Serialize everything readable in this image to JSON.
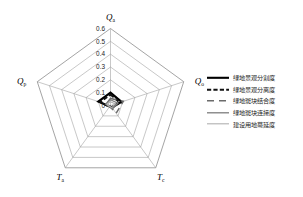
{
  "chart_data": {
    "type": "radar",
    "title": "",
    "categories": [
      "Q_a",
      "Q_o",
      "T_c",
      "T_a",
      "Q_p"
    ],
    "category_labels": [
      {
        "base": "Q",
        "sub": "a"
      },
      {
        "base": "Q",
        "sub": "o"
      },
      {
        "base": "T",
        "sub": "c"
      },
      {
        "base": "T",
        "sub": "a"
      },
      {
        "base": "Q",
        "sub": "p"
      }
    ],
    "tick_labels": [
      "0.6",
      "0.5",
      "0.4",
      "0.3",
      "0.2",
      "0.1",
      "0"
    ],
    "tick_values": [
      0.6,
      0.5,
      0.4,
      0.3,
      0.2,
      0.1,
      0
    ],
    "rlim": [
      0,
      0.6
    ],
    "grid": true,
    "legend_position": "right",
    "series": [
      {
        "name": "绿地景观分割度",
        "style": "solid-thick",
        "color": "#000000",
        "width": 2.1,
        "values": [
          0.1,
          0.09,
          0.02,
          0.01,
          0.1
        ]
      },
      {
        "name": "绿地景观分离度",
        "style": "dashed-thick",
        "color": "#111111",
        "width": 2.0,
        "values": [
          0.085,
          0.075,
          0.015,
          0.012,
          0.085
        ]
      },
      {
        "name": "绿地斑块结合度",
        "style": "longdash",
        "color": "#6b6b6b",
        "width": 1.5,
        "values": [
          0.055,
          0.105,
          0.075,
          0.01,
          0.035
        ]
      },
      {
        "name": "绿地斑块连接度",
        "style": "solid-medium",
        "color": "#7d7d7d",
        "width": 1.3,
        "values": [
          0.045,
          0.06,
          0.03,
          0.013,
          0.04
        ]
      },
      {
        "name": "建设用地蔓延度",
        "style": "solid-light",
        "color": "#b0b0b0",
        "width": 1.1,
        "values": [
          0.03,
          0.04,
          0.02,
          0.009,
          0.028
        ]
      }
    ]
  },
  "legend": {
    "items": [
      {
        "label": "绿地景观分割度"
      },
      {
        "label": "绿地景观分离度"
      },
      {
        "label": "绿地斑块结合度"
      },
      {
        "label": "绿地斑块连接度"
      },
      {
        "label": "建设用地蔓延度"
      }
    ]
  },
  "axes": {
    "top": {
      "base": "Q",
      "sub": "a"
    },
    "right": {
      "base": "Q",
      "sub": "o"
    },
    "bottom_right": {
      "base": "T",
      "sub": "c"
    },
    "bottom_left": {
      "base": "T",
      "sub": "a"
    },
    "left": {
      "base": "Q",
      "sub": "p"
    }
  },
  "ticks": {
    "t0": "0.6",
    "t1": "0.5",
    "t2": "0.4",
    "t3": "0.3",
    "t4": "0.2",
    "t5": "0.1",
    "t6": "0"
  }
}
